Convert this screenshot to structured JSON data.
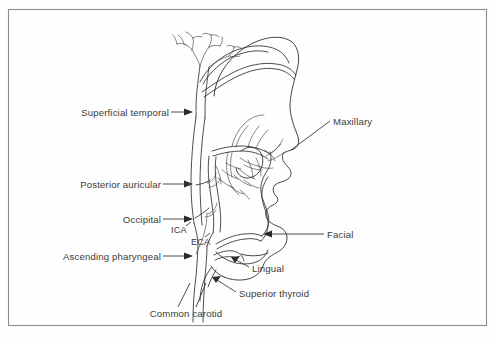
{
  "figure": {
    "view": "lateral profile, facing right",
    "background_color": "#fefefe",
    "line_color": "#2e2e2e",
    "text_color": "#3a3a3a",
    "frame_color": "#8c8c8c"
  },
  "labels": {
    "superficial_temporal": "Superficial temporal",
    "posterior_auricular": "Posterior auricular",
    "occipital": "Occipital",
    "ascending_pharyngeal": "Ascending pharyngeal",
    "common_carotid": "Common carotid",
    "maxillary": "Maxillary",
    "facial": "Facial",
    "lingual": "Lingual",
    "superior_thyroid": "Superior thyroid",
    "ica": "ICA",
    "eca": "ECA"
  },
  "label_list": [
    {
      "id": "superficial-temporal",
      "text": "Superficial temporal",
      "side": "left",
      "x": 168,
      "y": 116,
      "arrow_x": 193,
      "arrow_y": 112
    },
    {
      "id": "posterior-auricular",
      "text": "Posterior auricular",
      "side": "left",
      "x": 160,
      "y": 187,
      "arrow_x": 193,
      "arrow_y": 184
    },
    {
      "id": "occipital",
      "text": "Occipital",
      "side": "left",
      "x": 160,
      "y": 223,
      "arrow_x": 193,
      "arrow_y": 219
    },
    {
      "id": "ascending-pharyngeal",
      "text": "Ascending pharyngeal",
      "side": "left",
      "x": 160,
      "y": 259,
      "arrow_x": 193,
      "arrow_y": 256
    },
    {
      "id": "common-carotid",
      "text": "Common carotid",
      "side": "bottom",
      "x": 148,
      "y": 315,
      "arrow_x": 202,
      "arrow_y": 288
    },
    {
      "id": "maxillary",
      "text": "Maxillary",
      "side": "right",
      "x": 333,
      "y": 124,
      "arrow_x": 288,
      "arrow_y": 152
    },
    {
      "id": "facial",
      "text": "Facial",
      "side": "right",
      "x": 327,
      "y": 237,
      "arrow_x": 263,
      "arrow_y": 234
    },
    {
      "id": "lingual",
      "text": "Lingual",
      "side": "right",
      "x": 252,
      "y": 271,
      "arrow_x": 231,
      "arrow_y": 257
    },
    {
      "id": "superior-thyroid",
      "text": "Superior thyroid",
      "side": "right",
      "x": 239,
      "y": 296,
      "arrow_x": 212,
      "arrow_y": 277
    },
    {
      "id": "ica",
      "text": "ICA",
      "side": "inline",
      "x": 174,
      "y": 231,
      "arrow_x": null,
      "arrow_y": null
    },
    {
      "id": "eca",
      "text": "ECA",
      "side": "inline",
      "x": 192,
      "y": 242,
      "arrow_x": null,
      "arrow_y": null
    }
  ],
  "anatomy": {
    "arteries": [
      "Common carotid",
      "Internal carotid (ICA)",
      "External carotid (ECA)",
      "Superior thyroid",
      "Lingual",
      "Facial",
      "Ascending pharyngeal",
      "Occipital",
      "Posterior auricular",
      "Superficial temporal",
      "Maxillary"
    ]
  },
  "frame": {
    "x": 8,
    "y": 9,
    "width": 479,
    "height": 317
  }
}
